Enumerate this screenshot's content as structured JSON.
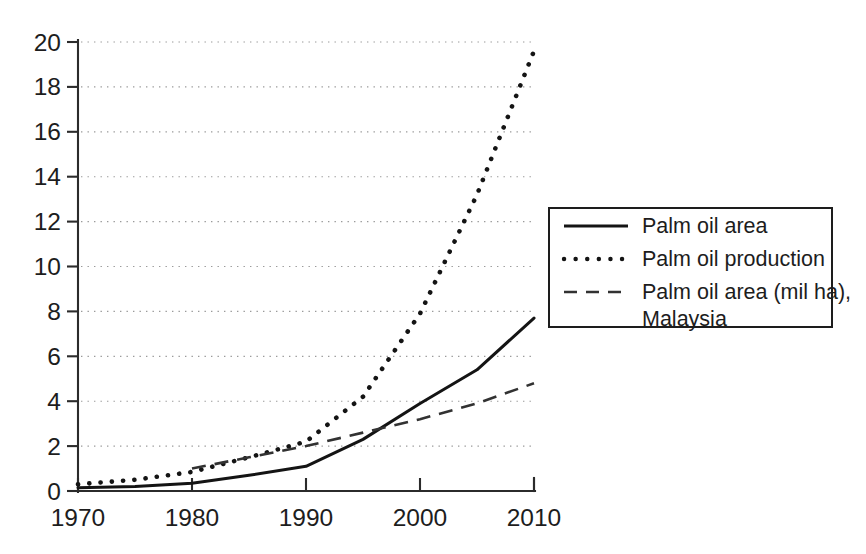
{
  "chart_data": {
    "type": "line",
    "title": "",
    "subtitle": "",
    "xlabel": "",
    "ylabel": "",
    "xlim": [
      1970,
      2010
    ],
    "ylim": [
      0,
      20
    ],
    "grid": "horizontal-dotted",
    "legend_position": "right",
    "x_ticks": [
      "1970",
      "1980",
      "1990",
      "2000",
      "2010"
    ],
    "y_ticks": [
      "0",
      "2",
      "4",
      "6",
      "8",
      "10",
      "12",
      "14",
      "16",
      "18",
      "20"
    ],
    "series": [
      {
        "name": "Palm oil area",
        "style": "solid",
        "x": [
          1970,
          1975,
          1980,
          1985,
          1990,
          1995,
          2000,
          2005,
          2010
        ],
        "values": [
          0.15,
          0.2,
          0.35,
          0.7,
          1.1,
          2.3,
          3.9,
          5.4,
          7.7
        ]
      },
      {
        "name": "Palm oil production",
        "style": "dotted",
        "x": [
          1970,
          1975,
          1980,
          1985,
          1990,
          1995,
          2000,
          2005,
          2010
        ],
        "values": [
          0.3,
          0.5,
          0.85,
          1.5,
          2.2,
          4.2,
          7.9,
          13.2,
          19.6
        ]
      },
      {
        "name": "Palm oil area (mil ha), Malaysia",
        "style": "dashed",
        "x": [
          1980,
          1985,
          1990,
          1995,
          2000,
          2005,
          2010
        ],
        "values": [
          1.0,
          1.5,
          2.0,
          2.6,
          3.2,
          3.9,
          4.8
        ]
      }
    ]
  },
  "legend": {
    "entries": [
      {
        "label": "Palm oil area",
        "style": "solid"
      },
      {
        "label": "Palm oil production",
        "style": "dotted"
      },
      {
        "label": "Palm oil area (mil ha),",
        "label2": "Malaysia",
        "style": "dashed"
      }
    ]
  },
  "colors": {
    "line": "#141414",
    "axis": "#2b2b2b",
    "grid": "#9a9a9a",
    "text": "#1d1d1d",
    "background": "#ffffff"
  }
}
